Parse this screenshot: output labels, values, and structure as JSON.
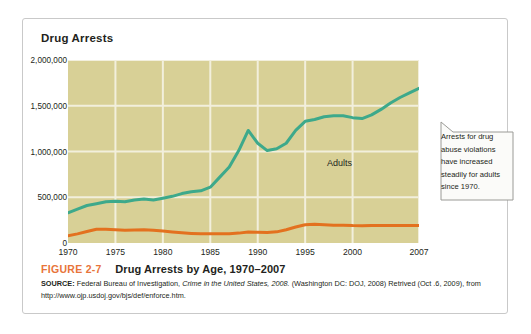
{
  "figure": {
    "chart_title": "Drug Arrests",
    "number": "FIGURE 2-7",
    "title": "Drug Arrests by Age, 1970–2007",
    "source_label": "SOURCE:",
    "source_part1": " Federal Bureau of Investigation, ",
    "source_italic": "Crime in the United States, 2008.",
    "source_part2": " (Washington DC: DOJ, 2008) Retrived (Oct .6, 2009), from http://www.ojp.usdoj.gov/bjs/def/enforce.htm."
  },
  "callout": {
    "text": "Arrests for drug abuse violations have increased steadily for adults since 1970."
  },
  "colors": {
    "plot_background": "#d8d096",
    "gridline": "#f2efdc",
    "adults_line": "#3da98b",
    "juveniles_line": "#e3711f",
    "figure_number": "#e8743a",
    "card_border": "#c9c9c9",
    "callout_fill": "#fbfbf9",
    "callout_border": "#9a9a96"
  },
  "chart_data": {
    "type": "line",
    "title": "Drug Arrests",
    "xlabel": "",
    "ylabel": "Drug Arrests",
    "xlim": [
      1970,
      2007
    ],
    "ylim": [
      0,
      2000000
    ],
    "grid": true,
    "legend": "inline-labels",
    "ytick_labels": [
      "2,000,000",
      "1,500,000",
      "1,000,000",
      "500,000",
      "0"
    ],
    "ytick_values": [
      2000000,
      1500000,
      1000000,
      500000,
      0
    ],
    "xtick_labels": [
      "1970",
      "1975",
      "1980",
      "1985",
      "1990",
      "1995",
      "2000",
      "2007"
    ],
    "xtick_values": [
      1970,
      1975,
      1980,
      1985,
      1990,
      1995,
      2000,
      2007
    ],
    "x": [
      1970,
      1971,
      1972,
      1973,
      1974,
      1975,
      1976,
      1977,
      1978,
      1979,
      1980,
      1981,
      1982,
      1983,
      1984,
      1985,
      1986,
      1987,
      1988,
      1989,
      1990,
      1991,
      1992,
      1993,
      1994,
      1995,
      1996,
      1997,
      1998,
      1999,
      2000,
      2001,
      2002,
      2003,
      2004,
      2005,
      2006,
      2007
    ],
    "series": [
      {
        "name": "Adults",
        "color": "#3da98b",
        "values": [
          330000,
          370000,
          410000,
          430000,
          450000,
          455000,
          450000,
          470000,
          480000,
          470000,
          490000,
          510000,
          540000,
          560000,
          570000,
          610000,
          720000,
          830000,
          1010000,
          1230000,
          1090000,
          1010000,
          1030000,
          1090000,
          1230000,
          1330000,
          1350000,
          1380000,
          1390000,
          1390000,
          1370000,
          1360000,
          1400000,
          1460000,
          1530000,
          1590000,
          1640000,
          1690000
        ],
        "annotation": "Adults"
      },
      {
        "name": "Juveniles",
        "color": "#e3711f",
        "values": [
          80000,
          100000,
          125000,
          150000,
          150000,
          145000,
          140000,
          142000,
          145000,
          140000,
          130000,
          120000,
          112000,
          105000,
          100000,
          100000,
          100000,
          102000,
          108000,
          120000,
          118000,
          115000,
          122000,
          145000,
          175000,
          200000,
          205000,
          200000,
          195000,
          195000,
          190000,
          188000,
          190000,
          190000,
          190000,
          190000,
          190000,
          190000
        ],
        "annotation": "Juveniles"
      }
    ]
  }
}
